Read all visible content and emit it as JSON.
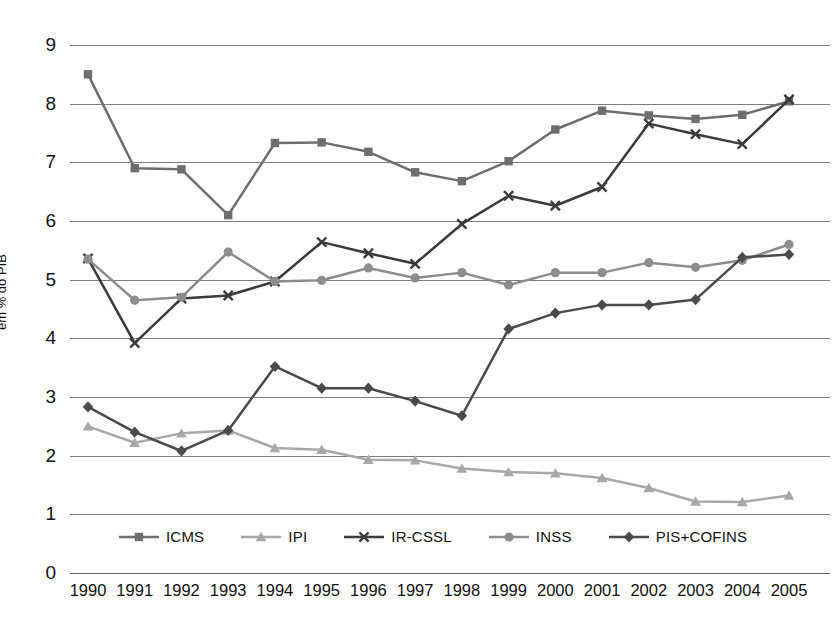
{
  "chart_data": {
    "type": "line",
    "title": "",
    "xlabel": "",
    "ylabel": "em % do PIB",
    "ylim": [
      0,
      9
    ],
    "ytick_step": 1,
    "grid": true,
    "legend_position": "bottom-inside",
    "categories": [
      "1990",
      "1991",
      "1992",
      "1993",
      "1994",
      "1995",
      "1996",
      "1997",
      "1998",
      "1999",
      "2000",
      "2001",
      "2002",
      "2003",
      "2004",
      "2005"
    ],
    "yticks": [
      "0",
      "1",
      "2",
      "3",
      "4",
      "5",
      "6",
      "7",
      "8",
      "9"
    ],
    "series": [
      {
        "name": "ICMS",
        "marker": "square",
        "color": "#6e6e6e",
        "values": [
          8.5,
          6.9,
          6.88,
          6.1,
          7.33,
          7.34,
          7.18,
          6.83,
          6.68,
          7.02,
          7.56,
          7.88,
          7.8,
          7.74,
          7.81,
          8.04
        ]
      },
      {
        "name": "IPI",
        "marker": "triangle",
        "color": "#a8a8a8",
        "values": [
          2.5,
          2.22,
          2.38,
          2.43,
          2.13,
          2.1,
          1.93,
          1.92,
          1.78,
          1.72,
          1.7,
          1.62,
          1.45,
          1.22,
          1.21,
          1.32
        ]
      },
      {
        "name": "IR-CSSL",
        "marker": "cross",
        "color": "#3a3a3a",
        "values": [
          5.36,
          3.92,
          4.68,
          4.73,
          4.97,
          5.64,
          5.45,
          5.27,
          5.95,
          6.43,
          6.26,
          6.58,
          7.66,
          7.48,
          7.31,
          8.07
        ]
      },
      {
        "name": "INSS",
        "marker": "circle",
        "color": "#8d8d8d",
        "values": [
          5.35,
          4.65,
          4.7,
          5.47,
          4.97,
          4.99,
          5.2,
          5.03,
          5.12,
          4.91,
          5.12,
          5.12,
          5.29,
          5.21,
          5.33,
          5.6
        ]
      },
      {
        "name": "PIS+COFINS",
        "marker": "diamond",
        "color": "#4a4a4a",
        "values": [
          2.83,
          2.4,
          2.08,
          2.43,
          3.52,
          3.15,
          3.15,
          2.93,
          2.68,
          4.16,
          4.43,
          4.57,
          4.57,
          4.66,
          5.38,
          5.43
        ]
      }
    ]
  }
}
